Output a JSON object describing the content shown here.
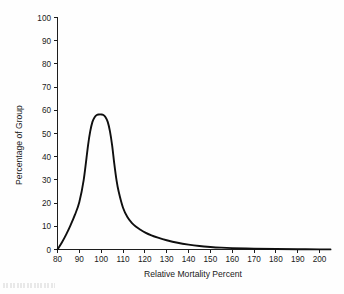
{
  "chart_data": {
    "type": "line",
    "title": "",
    "subtitle": "",
    "xlabel": "Relative Mortality Percent",
    "ylabel": "Percentage of Group",
    "xlim": [
      80,
      205
    ],
    "ylim": [
      0,
      100
    ],
    "xticks": [
      80,
      90,
      100,
      110,
      120,
      130,
      140,
      150,
      160,
      170,
      180,
      190,
      200
    ],
    "yticks": [
      0,
      10,
      20,
      30,
      40,
      50,
      60,
      70,
      80,
      90,
      100
    ],
    "xtick_labels": [
      "80",
      "90",
      "100",
      "110",
      "120",
      "130",
      "140",
      "150",
      "160",
      "170",
      "180",
      "190",
      "200"
    ],
    "ytick_labels": [
      "0",
      "10",
      "20",
      "30",
      "40",
      "50",
      "60",
      "70",
      "80",
      "90",
      "100"
    ],
    "grid": false,
    "legend": false,
    "legend_position": "none",
    "series": [
      {
        "name": "Percentage of Group",
        "color": "#0f0f0f",
        "x": [
          80,
          82,
          84,
          86,
          88,
          90,
          92,
          94,
          95,
          96,
          97,
          98,
          99,
          100,
          101,
          102,
          103,
          104,
          105,
          106,
          107,
          108,
          110,
          112,
          114,
          116,
          118,
          120,
          123,
          126,
          130,
          135,
          140,
          145,
          150,
          155,
          160,
          170,
          180,
          190,
          200,
          205
        ],
        "y": [
          0,
          3,
          6.5,
          10.5,
          15,
          20.5,
          30,
          45,
          51,
          55,
          57,
          58,
          58.2,
          58.2,
          58,
          57,
          55,
          51,
          45,
          37,
          30,
          25,
          18,
          14,
          11.5,
          9.8,
          8.5,
          7.4,
          6.1,
          5.1,
          4.0,
          2.9,
          2.1,
          1.5,
          1.1,
          0.8,
          0.6,
          0.35,
          0.2,
          0.12,
          0.06,
          0.04
        ]
      }
    ],
    "peak": {
      "x": 100,
      "y": 58
    }
  },
  "figure": {
    "background_color": "#ffffff",
    "axis_color": "#1d1d1d",
    "curve_color": "#0f0f0f"
  },
  "artifact": {
    "description": "scan-edge-smudge"
  }
}
